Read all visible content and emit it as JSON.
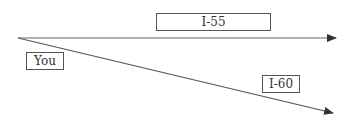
{
  "diagram": {
    "origin": {
      "label": "You"
    },
    "roads": [
      {
        "label": "I-55"
      },
      {
        "label": "I-60"
      }
    ],
    "colors": {
      "line": "#555555",
      "border": "#555555",
      "text": "#333333"
    }
  }
}
